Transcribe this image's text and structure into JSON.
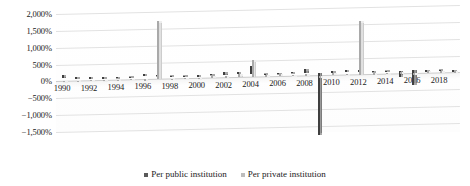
{
  "chart_data": {
    "type": "bar",
    "title": "",
    "subtitle": "",
    "xlabel": "",
    "ylabel": "",
    "ylim": [
      -1500,
      2000
    ],
    "y_ticks": [
      2000,
      1500,
      1000,
      500,
      0,
      -500,
      -1000,
      -1500
    ],
    "y_tick_labels": [
      "2,000%",
      "1,500%",
      "1,000%",
      "500%",
      "0%",
      "−500%",
      "−1,000%",
      "−1,500%"
    ],
    "grid": true,
    "legend_position": "bottom",
    "categories": [
      "1990",
      "1991",
      "1992",
      "1993",
      "1994",
      "1995",
      "1996",
      "1997",
      "1998",
      "1999",
      "2000",
      "2001",
      "2002",
      "2003",
      "2004",
      "2005",
      "2006",
      "2007",
      "2008",
      "2009",
      "2010",
      "2011",
      "2012",
      "2013",
      "2014",
      "2015",
      "2016",
      "2017",
      "2018",
      "2019"
    ],
    "x_tick_labels": [
      "1990",
      "1992",
      "1994",
      "1996",
      "1998",
      "2000",
      "2002",
      "2004",
      "2006",
      "2008",
      "2010",
      "2012",
      "2014",
      "2016",
      "2018"
    ],
    "series": [
      {
        "name": "Per public institution",
        "color": "#6e6e6e",
        "values": [
          90,
          20,
          10,
          -15,
          10,
          -20,
          60,
          40,
          -30,
          -40,
          -20,
          30,
          70,
          60,
          250,
          -30,
          20,
          40,
          120,
          -1850,
          30,
          50,
          40,
          20,
          -30,
          -180,
          -420,
          -40,
          -30,
          -60
        ]
      },
      {
        "name": "Per private institution",
        "color": "#cccccc",
        "values": [
          20,
          -10,
          30,
          20,
          -10,
          25,
          -15,
          1720,
          -20,
          30,
          20,
          60,
          40,
          110,
          520,
          40,
          60,
          30,
          50,
          -60,
          80,
          40,
          1600,
          30,
          40,
          60,
          -20,
          50,
          70,
          40
        ]
      }
    ],
    "legend": [
      {
        "label": "Per public institution",
        "marker": "square",
        "color": "#5a5a5a"
      },
      {
        "label": "Per private institution",
        "marker": "square",
        "color": "#bdbdbd"
      }
    ]
  }
}
